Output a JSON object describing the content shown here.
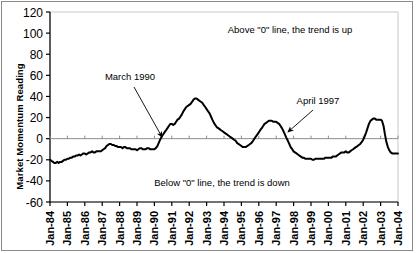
{
  "chart_data": {
    "type": "line",
    "title": "",
    "xlabel": "",
    "ylabel": "Market Momentum Reading",
    "ylim": [
      -60,
      120
    ],
    "yticks": [
      -60,
      -40,
      -20,
      0,
      20,
      40,
      60,
      80,
      100,
      120
    ],
    "ytick_labels": [
      "-60",
      "-40",
      "-20",
      "0",
      "20",
      "40",
      "60",
      "80",
      "100",
      "120"
    ],
    "grid": false,
    "legend": "none",
    "xtick_labels": [
      "Jan-84",
      "Jan-85",
      "Jan-86",
      "Jan-87",
      "Jan-88",
      "Jan-89",
      "Jan-90",
      "Jan-91",
      "Jan-92",
      "Jan-93",
      "Jan-94",
      "Jan-95",
      "Jan-96",
      "Jan-97",
      "Jan-98",
      "Jan-99",
      "Jan-00",
      "Jan-01",
      "Jan-02",
      "Jan-03",
      "Jan-04"
    ],
    "xlim": [
      "Jan-84",
      "Jan-04"
    ],
    "zero_line": 0,
    "series": [
      {
        "name": "Market Momentum Reading",
        "color": "#000000",
        "x": [
          1984.0,
          1984.08,
          1984.17,
          1984.25,
          1984.33,
          1984.42,
          1984.5,
          1984.58,
          1984.67,
          1984.75,
          1984.83,
          1984.92,
          1985.0,
          1985.08,
          1985.17,
          1985.25,
          1985.33,
          1985.42,
          1985.5,
          1985.58,
          1985.67,
          1985.75,
          1985.83,
          1985.92,
          1986.0,
          1986.08,
          1986.17,
          1986.25,
          1986.33,
          1986.42,
          1986.5,
          1986.58,
          1986.67,
          1986.75,
          1986.83,
          1986.92,
          1987.0,
          1987.08,
          1987.17,
          1987.25,
          1987.33,
          1987.42,
          1987.5,
          1987.58,
          1987.67,
          1987.75,
          1987.83,
          1987.92,
          1988.0,
          1988.08,
          1988.17,
          1988.25,
          1988.33,
          1988.42,
          1988.5,
          1988.58,
          1988.67,
          1988.75,
          1988.83,
          1988.92,
          1989.0,
          1989.08,
          1989.17,
          1989.25,
          1989.33,
          1989.42,
          1989.5,
          1989.58,
          1989.67,
          1989.75,
          1989.83,
          1989.92,
          1990.0,
          1990.08,
          1990.17,
          1990.25,
          1990.33,
          1990.42,
          1990.5,
          1990.58,
          1990.67,
          1990.75,
          1990.83,
          1990.92,
          1991.0,
          1991.08,
          1991.17,
          1991.25,
          1991.33,
          1991.42,
          1991.5,
          1991.58,
          1991.67,
          1991.75,
          1991.83,
          1991.92,
          1992.0,
          1992.08,
          1992.17,
          1992.25,
          1992.33,
          1992.42,
          1992.5,
          1992.58,
          1992.67,
          1992.75,
          1992.83,
          1992.92,
          1993.0,
          1993.08,
          1993.17,
          1993.25,
          1993.33,
          1993.42,
          1993.5,
          1993.58,
          1993.67,
          1993.75,
          1993.83,
          1993.92,
          1994.0,
          1994.08,
          1994.17,
          1994.25,
          1994.33,
          1994.42,
          1994.5,
          1994.58,
          1994.67,
          1994.75,
          1994.83,
          1994.92,
          1995.0,
          1995.08,
          1995.17,
          1995.25,
          1995.33,
          1995.42,
          1995.5,
          1995.58,
          1995.67,
          1995.75,
          1995.83,
          1995.92,
          1996.0,
          1996.08,
          1996.17,
          1996.25,
          1996.33,
          1996.42,
          1996.5,
          1996.58,
          1996.67,
          1996.75,
          1996.83,
          1996.92,
          1997.0,
          1997.08,
          1997.17,
          1997.25,
          1997.33,
          1997.42,
          1997.5,
          1997.58,
          1997.67,
          1997.75,
          1997.83,
          1997.92,
          1998.0,
          1998.08,
          1998.17,
          1998.25,
          1998.33,
          1998.42,
          1998.5,
          1998.58,
          1998.67,
          1998.75,
          1998.83,
          1998.92,
          1999.0,
          1999.08,
          1999.17,
          1999.25,
          1999.33,
          1999.42,
          1999.5,
          1999.58,
          1999.67,
          1999.75,
          1999.83,
          1999.92,
          2000.0,
          2000.08,
          2000.17,
          2000.25,
          2000.33,
          2000.42,
          2000.5,
          2000.58,
          2000.67,
          2000.75,
          2000.83,
          2000.92,
          2001.0,
          2001.08,
          2001.17,
          2001.25,
          2001.33,
          2001.42,
          2001.5,
          2001.58,
          2001.67,
          2001.75,
          2001.83,
          2001.92,
          2002.0,
          2002.08,
          2002.17,
          2002.25,
          2002.33,
          2002.42,
          2002.5,
          2002.58,
          2002.67,
          2002.75,
          2002.83,
          2002.92,
          2003.0,
          2003.08,
          2003.17,
          2003.25,
          2003.33,
          2003.42,
          2003.5,
          2003.58,
          2003.67,
          2003.75,
          2003.83,
          2003.92,
          2004.0
        ],
        "values": [
          -20,
          -21,
          -22,
          -23,
          -23,
          -22,
          -23,
          -22,
          -22,
          -21,
          -20,
          -20,
          -19,
          -19,
          -18,
          -18,
          -17,
          -17,
          -16,
          -16,
          -15,
          -16,
          -15,
          -14,
          -14,
          -15,
          -14,
          -13,
          -13,
          -12,
          -13,
          -13,
          -12,
          -12,
          -12,
          -12,
          -11,
          -10,
          -9,
          -7,
          -6,
          -5,
          -5,
          -6,
          -6,
          -7,
          -7,
          -8,
          -8,
          -8,
          -9,
          -8,
          -8,
          -9,
          -9,
          -9,
          -10,
          -10,
          -10,
          -10,
          -11,
          -10,
          -9,
          -9,
          -10,
          -10,
          -10,
          -9,
          -9,
          -10,
          -10,
          -10,
          -10,
          -9,
          -7,
          -4,
          -1,
          2,
          4,
          6,
          8,
          10,
          12,
          14,
          14,
          13,
          14,
          16,
          18,
          19,
          21,
          23,
          26,
          28,
          30,
          31,
          32,
          33,
          35,
          37,
          38,
          38,
          37,
          36,
          35,
          34,
          32,
          30,
          28,
          26,
          24,
          21,
          18,
          15,
          13,
          11,
          10,
          9,
          8,
          7,
          6,
          5,
          4,
          3,
          2,
          1,
          0,
          -1,
          -2,
          -4,
          -5,
          -6,
          -7,
          -8,
          -8,
          -8,
          -7,
          -6,
          -5,
          -4,
          -2,
          0,
          2,
          4,
          6,
          8,
          10,
          12,
          14,
          15,
          16,
          17,
          17,
          17,
          16,
          16,
          16,
          15,
          14,
          12,
          10,
          7,
          4,
          1,
          -2,
          -5,
          -8,
          -10,
          -12,
          -13,
          -14,
          -15,
          -16,
          -17,
          -18,
          -18,
          -19,
          -19,
          -19,
          -19,
          -19,
          -20,
          -20,
          -19,
          -19,
          -19,
          -19,
          -19,
          -19,
          -19,
          -18,
          -18,
          -18,
          -18,
          -18,
          -17,
          -17,
          -17,
          -16,
          -15,
          -14,
          -13,
          -13,
          -13,
          -12,
          -13,
          -13,
          -12,
          -11,
          -10,
          -9,
          -8,
          -7,
          -6,
          -5,
          -3,
          -1,
          2,
          6,
          10,
          14,
          17,
          18,
          19,
          19,
          18,
          18,
          18,
          18,
          17,
          12,
          4,
          -3,
          -8,
          -11,
          -13,
          -14,
          -14,
          -14,
          -14,
          -14
        ]
      }
    ],
    "annotations": [
      {
        "id": "annotation-above-zero",
        "text": "Above \"0\" line, the trend is up",
        "x": 290,
        "y": 33
      },
      {
        "id": "annotation-below-zero",
        "text": "Below \"0\" line, the trend is down",
        "x": 222,
        "y": 186
      },
      {
        "id": "annotation-march-1990",
        "text": "March 1990",
        "x": 130,
        "y": 80,
        "arrow_from": [
          134,
          87
        ],
        "arrow_to": [
          162,
          137
        ]
      },
      {
        "id": "annotation-april-1997",
        "text": "April 1997",
        "x": 318,
        "y": 104,
        "arrow_from": [
          313,
          110
        ],
        "arrow_to": [
          288,
          132
        ]
      }
    ]
  }
}
